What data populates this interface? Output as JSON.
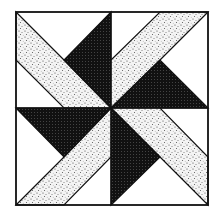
{
  "diagram": {
    "layout": "2x2 quadrants rotating around center",
    "colors": {
      "background": "#ffffff",
      "outline": "#111111",
      "dark": "#1a1a1a",
      "speckle_base": "#f2f2f2",
      "speckle_dot": "#555555"
    },
    "quadrants": [
      {
        "name": "top-left",
        "dark_triangle": "upper-right",
        "strip": "from top-left corner toward center"
      },
      {
        "name": "top-right",
        "dark_triangle": "lower",
        "strip": "from top edge toward center"
      },
      {
        "name": "bottom-right",
        "dark_triangle": "left",
        "strip": "from center toward bottom-right corner"
      },
      {
        "name": "bottom-left",
        "dark_triangle": "upper",
        "strip": "from bottom edge toward center"
      }
    ]
  }
}
